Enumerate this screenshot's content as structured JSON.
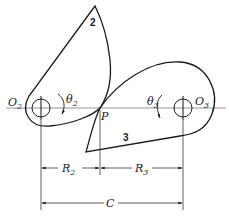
{
  "figure": {
    "type": "rolling-contact cam pair diagram",
    "labels": {
      "body_2": "2",
      "body_3": "3",
      "center_2": "O",
      "center_2_sub": "2",
      "center_3": "O",
      "center_3_sub": "3",
      "angle_2": "θ",
      "angle_2_sub": "2",
      "angle_3": "θ",
      "angle_3_sub": "3",
      "contact_point": "P",
      "radius_2": "R",
      "radius_2_sub": "2",
      "radius_3": "R",
      "radius_3_sub": "3",
      "center_distance": "C"
    },
    "colors": {
      "ink": "#1a1a1a",
      "background": "#ffffff",
      "centerline": "#7a7a7a"
    }
  }
}
